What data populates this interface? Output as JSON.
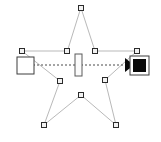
{
  "canvas": {
    "width": 161,
    "height": 142,
    "background_color": "#ffffff",
    "label": "vector-editor-canvas"
  },
  "colors": {
    "path_stroke": "#b9b9b9",
    "connector_stroke": "#4a4a4a",
    "node_handle_fill": "#f2f2f2",
    "node_handle_stroke": "#2b2b2b",
    "start_marker_fill": "#ffffff",
    "start_marker_stroke": "#3d3d3d",
    "mid_marker_fill": "#fbfbfb",
    "mid_marker_stroke": "#5a5a5a",
    "end_marker_fill": "#0a0a0a",
    "end_marker_stroke": "#3d3d3d",
    "arrow_fill": "#0a0a0a"
  },
  "shapes": {
    "star_path": {
      "name": "star-path",
      "stroke_width": 1,
      "fill": "none",
      "points": [
        [
          81,
          8
        ],
        [
          95,
          51
        ],
        [
          137,
          51
        ],
        [
          105,
          80
        ],
        [
          116,
          125
        ],
        [
          81,
          95
        ],
        [
          44,
          125
        ],
        [
          60,
          81
        ],
        [
          22,
          51
        ],
        [
          67,
          51
        ]
      ]
    },
    "connector": {
      "name": "dashed-connector",
      "stroke_width": 1,
      "dash_pattern": "2 2",
      "from": [
        33,
        65
      ],
      "to": [
        128,
        65
      ]
    }
  },
  "markers": {
    "start": {
      "name": "start-square-marker",
      "x": 17,
      "y": 57,
      "width": 17,
      "height": 17
    },
    "middle": {
      "name": "mid-rectangle-marker",
      "x": 75,
      "y": 54,
      "width": 7,
      "height": 22
    },
    "arrowhead": {
      "name": "connector-arrowhead",
      "points": "125,58 125,72 134,65"
    },
    "end": {
      "name": "end-square-marker",
      "x": 130,
      "y": 56,
      "width": 19,
      "height": 19,
      "inner_inset": 3
    }
  },
  "node_handles": [
    {
      "name": "node-handle-star-top",
      "x": 81,
      "y": 8
    },
    {
      "name": "node-handle-star-inner-right-up",
      "x": 95,
      "y": 51
    },
    {
      "name": "node-handle-star-right-outer",
      "x": 137,
      "y": 51
    },
    {
      "name": "node-handle-star-inner-right",
      "x": 105,
      "y": 80
    },
    {
      "name": "node-handle-star-bottom-right",
      "x": 116,
      "y": 125
    },
    {
      "name": "node-handle-star-inner-bottom",
      "x": 81,
      "y": 95
    },
    {
      "name": "node-handle-star-bottom-left",
      "x": 44,
      "y": 125
    },
    {
      "name": "node-handle-star-inner-left",
      "x": 60,
      "y": 81
    },
    {
      "name": "node-handle-star-left-outer",
      "x": 22,
      "y": 51
    },
    {
      "name": "node-handle-star-inner-left-up",
      "x": 67,
      "y": 51
    }
  ],
  "handle_size": 5
}
